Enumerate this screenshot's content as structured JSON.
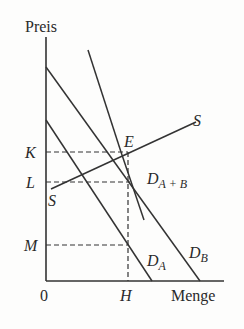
{
  "diagram": {
    "type": "supply-demand",
    "axes": {
      "y_label": "Preis",
      "x_label": "Menge",
      "origin_label": "0"
    },
    "price_levels": [
      {
        "label": "K",
        "y": 152
      },
      {
        "label": "L",
        "y": 182
      },
      {
        "label": "M",
        "y": 245
      }
    ],
    "quantity_levels": [
      {
        "label": "H",
        "x": 128
      }
    ],
    "curves": {
      "supply": {
        "label_start": "S",
        "label_end": "S"
      },
      "demand_a": {
        "label_main": "D",
        "label_sub": "A"
      },
      "demand_b": {
        "label_main": "D",
        "label_sub": "B"
      },
      "demand_sum": {
        "label_main": "D",
        "label_sub": "A + B"
      }
    },
    "equilibrium_label": "E",
    "colors": {
      "line": "#333333",
      "background": "#fdfdfc"
    }
  }
}
